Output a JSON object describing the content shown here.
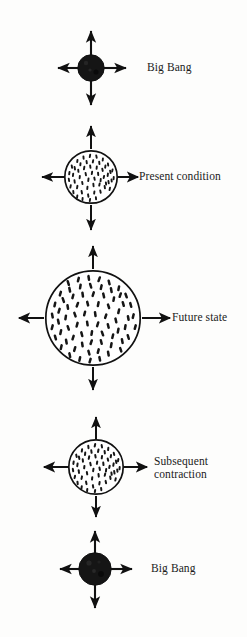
{
  "figure": {
    "kind": "oscillating-universe-cycle-diagram",
    "background_color": "#fdfdfc",
    "ink_color": "#111111",
    "stage_count": 5
  },
  "stages": [
    {
      "id": "big-bang-start",
      "label": "Big Bang",
      "label_lines": [
        "Big Bang"
      ],
      "body_style": "solid-filled",
      "fill_color": "#151515",
      "radius": 13,
      "center_x": 91,
      "center_y": 68,
      "arrow_direction": "outward",
      "arrow_count": 4,
      "label_x": 147,
      "label_y": 61
    },
    {
      "id": "present-condition",
      "label": "Present condition",
      "label_lines": [
        "Present condition"
      ],
      "body_style": "stippled-outline",
      "fill_color": "#ffffff",
      "radius": 26,
      "center_x": 91,
      "center_y": 177,
      "arrow_direction": "outward",
      "arrow_count": 4,
      "label_x": 139,
      "label_y": 170
    },
    {
      "id": "future-state",
      "label": "Future state",
      "label_lines": [
        "Future state"
      ],
      "body_style": "stippled-outline",
      "fill_color": "#ffffff",
      "radius": 47,
      "center_x": 93,
      "center_y": 318,
      "arrow_direction": "outward",
      "arrow_count": 4,
      "label_x": 172,
      "label_y": 311
    },
    {
      "id": "subsequent-contraction",
      "label": "Subsequent contraction",
      "label_lines": [
        "Subsequent",
        "contraction"
      ],
      "body_style": "stippled-outline",
      "fill_color": "#ffffff",
      "radius": 27,
      "center_x": 96,
      "center_y": 467,
      "arrow_direction": "outward",
      "arrow_count": 4,
      "label_x": 154,
      "label_y": 455
    },
    {
      "id": "big-bang-end",
      "label": "Big Bang",
      "label_lines": [
        "Big Bang"
      ],
      "body_style": "solid-filled",
      "fill_color": "#151515",
      "radius": 16,
      "center_x": 95,
      "center_y": 569,
      "arrow_direction": "outward",
      "arrow_count": 4,
      "label_x": 151,
      "label_y": 562
    }
  ]
}
